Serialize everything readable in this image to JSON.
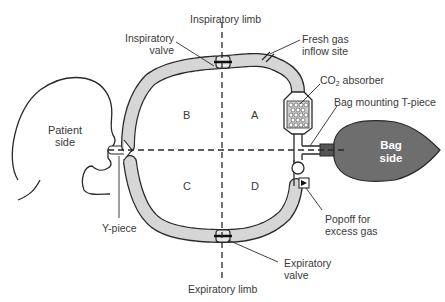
{
  "labels": {
    "inspiratory_limb": "Inspiratory limb",
    "inspiratory_valve_line1": "Inspiratory",
    "inspiratory_valve_line2": "valve",
    "fresh_gas_line1": "Fresh gas",
    "fresh_gas_line2": "inflow site",
    "co2_prefix": "CO",
    "co2_sub": "2",
    "co2_suffix": " absorber",
    "bag_mounting": "Bag mounting T-piece",
    "bag_line1": "Bag",
    "bag_line2": "side",
    "patient_line1": "Patient",
    "patient_line2": "side",
    "y_piece": "Y-piece",
    "popoff_line1": "Popoff for",
    "popoff_line2": "excess gas",
    "expiratory_valve_line1": "Expiratory",
    "expiratory_valve_line2": "valve",
    "expiratory_limb": "Expiratory limb"
  },
  "quadrants": {
    "A": "A",
    "B": "B",
    "C": "C",
    "D": "D"
  },
  "colors": {
    "tubing_fill": "#d6d6d6",
    "outline": "#2a2a2a",
    "bag_fill": "#6e6e6e",
    "text": "#3a3a3a",
    "background": "#ffffff"
  }
}
